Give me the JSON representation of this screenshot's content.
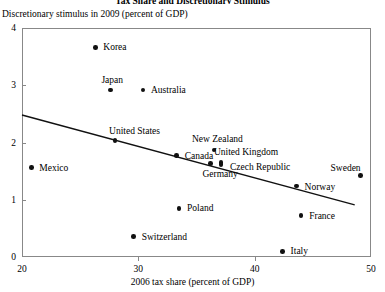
{
  "chart_data": {
    "type": "scatter",
    "title": "Tax Share and Discretionary Stimulus",
    "xlabel": "2006 tax share (percent of GDP)",
    "ylabel": "Discretionary stimulus in 2009 (percent of GDP)",
    "xlim": [
      20,
      50
    ],
    "ylim": [
      0,
      4
    ],
    "xticks": [
      "20",
      "30",
      "40",
      "50"
    ],
    "yticks": [
      "0",
      "1",
      "2",
      "3",
      "4"
    ],
    "grid": false,
    "legend": "none",
    "points": [
      {
        "label": "Korea",
        "x": 26.3,
        "y": 3.66,
        "label_dx": 8,
        "label_dy": -5
      },
      {
        "label": "Japan",
        "x": 27.6,
        "y": 2.92,
        "label_dx": -9,
        "label_dy": -15
      },
      {
        "label": "Australia",
        "x": 30.4,
        "y": 2.92,
        "label_dx": 8,
        "label_dy": -5
      },
      {
        "label": "Mexico",
        "x": 20.8,
        "y": 1.56,
        "label_dx": 8,
        "label_dy": -5
      },
      {
        "label": "United States",
        "x": 28.0,
        "y": 2.03,
        "label_dx": -6,
        "label_dy": -15
      },
      {
        "label": "Canada",
        "x": 33.3,
        "y": 1.77,
        "label_dx": 8,
        "label_dy": -5
      },
      {
        "label": "New Zealand",
        "x": 36.5,
        "y": 1.87,
        "label_dx": -22,
        "label_dy": -16
      },
      {
        "label": "United Kingdom",
        "x": 37.1,
        "y": 1.65,
        "label_dx": -7,
        "label_dy": -16
      },
      {
        "label": "Germany",
        "x": 36.2,
        "y": 1.63,
        "label_dx": -8,
        "label_dy": 5
      },
      {
        "label": "Czech Republic",
        "x": 37.1,
        "y": 1.62,
        "label_dx": 9,
        "label_dy": -2
      },
      {
        "label": "Sweden",
        "x": 49.1,
        "y": 1.42,
        "label_dx": -30,
        "label_dy": -13
      },
      {
        "label": "Norway",
        "x": 43.6,
        "y": 1.24,
        "label_dx": 8,
        "label_dy": -4
      },
      {
        "label": "Poland",
        "x": 33.5,
        "y": 0.85,
        "label_dx": 8,
        "label_dy": -5
      },
      {
        "label": "France",
        "x": 44.0,
        "y": 0.73,
        "label_dx": 8,
        "label_dy": -4
      },
      {
        "label": "Switzerland",
        "x": 29.6,
        "y": 0.36,
        "label_dx": 8,
        "label_dy": -4
      },
      {
        "label": "Italy",
        "x": 42.4,
        "y": 0.1,
        "label_dx": 8,
        "label_dy": -5
      }
    ],
    "trendline": {
      "x0": 20,
      "y0": 2.48,
      "x1": 48.6,
      "y1": 0.91
    }
  },
  "colors": {
    "point": "#111111",
    "axis": "#888888",
    "trendline": "#111111",
    "text": "#000000"
  }
}
